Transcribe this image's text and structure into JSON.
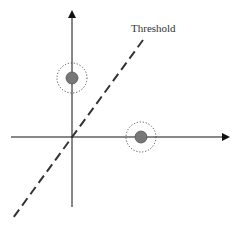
{
  "diagram": {
    "threshold_label": "Threshold",
    "colors": {
      "axis": "#111111",
      "threshold_line": "#333333",
      "point_fill": "#777777",
      "point_stroke": "#555555",
      "halo": "#444444"
    },
    "points": [
      {
        "name": "point-on-y-axis",
        "cx": 72,
        "cy": 78
      },
      {
        "name": "point-on-x-axis",
        "cx": 141,
        "cy": 137
      }
    ]
  }
}
